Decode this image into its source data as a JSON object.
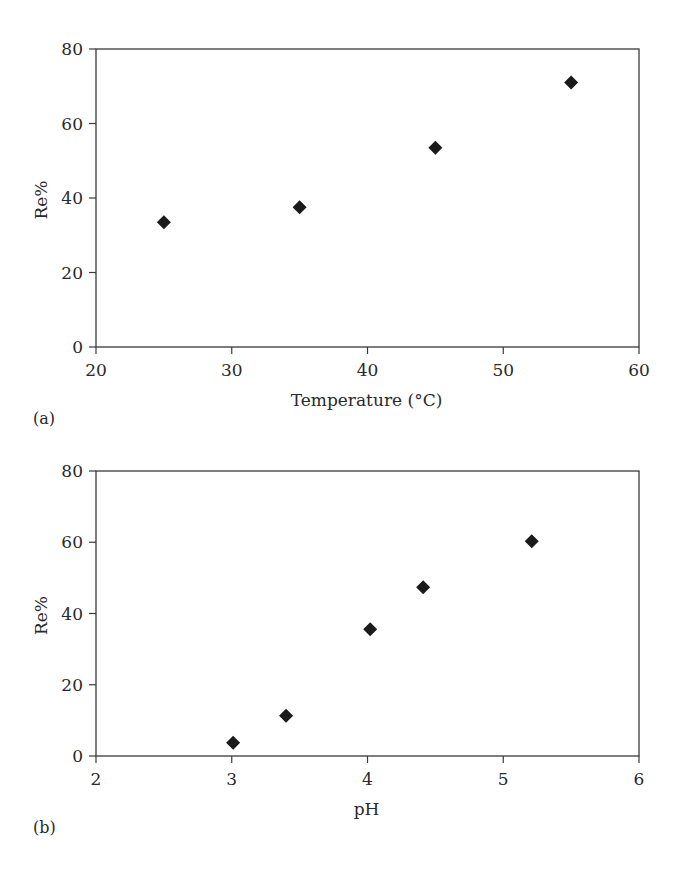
{
  "chart_data": [
    {
      "type": "scatter",
      "panel_label": "(a)",
      "title": "",
      "xlabel": "Temperature (°C)",
      "ylabel": "Re%",
      "xlim": [
        20,
        60
      ],
      "ylim": [
        0,
        80
      ],
      "xticks": [
        20,
        30,
        40,
        50,
        60
      ],
      "yticks": [
        0,
        20,
        40,
        60,
        80
      ],
      "grid": false,
      "legend": null,
      "marker": "diamond",
      "series": [
        {
          "name": "Re%",
          "x": [
            25,
            35,
            45,
            55
          ],
          "y": [
            33.5,
            37.5,
            53.5,
            71
          ]
        }
      ],
      "layout": {
        "left": 96,
        "right": 639,
        "top": 49,
        "bottom": 347
      }
    },
    {
      "type": "scatter",
      "panel_label": "(b)",
      "title": "",
      "xlabel": "pH",
      "ylabel": "Re%",
      "xlim": [
        2,
        6
      ],
      "ylim": [
        0,
        80
      ],
      "xticks": [
        2,
        3,
        4,
        5,
        6
      ],
      "yticks": [
        0,
        20,
        40,
        60,
        80
      ],
      "grid": false,
      "legend": null,
      "marker": "diamond",
      "series": [
        {
          "name": "Re%",
          "x": [
            3.01,
            3.4,
            4.02,
            4.41,
            5.21
          ],
          "y": [
            3.7,
            11.3,
            35.6,
            47.4,
            60.3
          ]
        }
      ],
      "layout": {
        "left": 96,
        "right": 639,
        "top": 471,
        "bottom": 756
      }
    }
  ],
  "colors": {
    "marker": "#1a1a1a",
    "axis": "#3a3a3a",
    "text": "#2a2a2a",
    "background": "#ffffff"
  }
}
